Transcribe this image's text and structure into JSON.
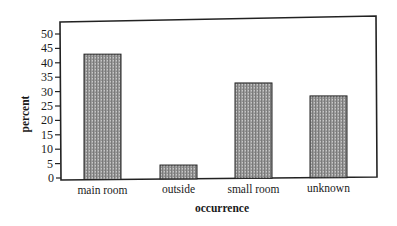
{
  "chart_data": {
    "type": "bar",
    "title": "",
    "xlabel": "occurrence",
    "ylabel": "percent",
    "categories": [
      "main room",
      "outside",
      "small room",
      "unknown"
    ],
    "values": [
      43,
      4.5,
      33,
      28.5
    ],
    "ylim": [
      0,
      50
    ],
    "yticks": [
      0,
      5,
      10,
      15,
      20,
      25,
      30,
      35,
      40,
      45,
      50
    ],
    "grid": false,
    "legend": null,
    "bar_fill": "stippled gray",
    "colors": {
      "bar_fill": "#a6a6a6",
      "bar_stroke": "#222222",
      "frame": "#222222",
      "text": "#1a1a1a"
    }
  }
}
